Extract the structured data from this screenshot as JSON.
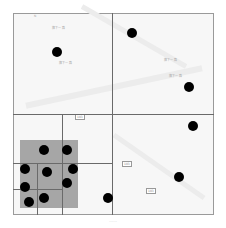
{
  "figure": {
    "type": "quadtree-over-map",
    "frame": {
      "x": 13,
      "y": 13,
      "width": 201,
      "height": 202
    },
    "colors": {
      "background": "#f7f7f7",
      "grid_line": "#6a6a6a",
      "shaded_region": "#a6a6a6",
      "point": "#000000",
      "frame": "#9a9a9a"
    },
    "shaded_region": {
      "x": 20,
      "y": 140,
      "width": 58,
      "height": 68
    },
    "grid_lines": [
      {
        "orientation": "vertical",
        "x": 113,
        "y1": 13,
        "y2": 215
      },
      {
        "orientation": "horizontal",
        "y": 114,
        "x1": 13,
        "x2": 214
      },
      {
        "orientation": "vertical",
        "x": 63,
        "y1": 114,
        "y2": 215
      },
      {
        "orientation": "horizontal",
        "y": 163,
        "x1": 13,
        "x2": 113
      },
      {
        "orientation": "vertical",
        "x": 37,
        "y1": 163,
        "y2": 215
      },
      {
        "orientation": "horizontal",
        "y": 189,
        "x1": 13,
        "x2": 63
      }
    ],
    "points": [
      {
        "x": 57,
        "y": 52
      },
      {
        "x": 132,
        "y": 33
      },
      {
        "x": 189,
        "y": 87
      },
      {
        "x": 193,
        "y": 126
      },
      {
        "x": 179,
        "y": 177
      },
      {
        "x": 44,
        "y": 150
      },
      {
        "x": 67,
        "y": 150
      },
      {
        "x": 25,
        "y": 169
      },
      {
        "x": 47,
        "y": 172
      },
      {
        "x": 73,
        "y": 169
      },
      {
        "x": 25,
        "y": 187
      },
      {
        "x": 67,
        "y": 183
      },
      {
        "x": 29,
        "y": 202
      },
      {
        "x": 44,
        "y": 198
      },
      {
        "x": 108,
        "y": 198
      }
    ],
    "map_labels": [
      "旗下一路",
      "旗下一路",
      "旗下一路",
      "旗下一路",
      "N"
    ],
    "signs": [
      "103",
      "103",
      "103"
    ],
    "caption": "……"
  }
}
